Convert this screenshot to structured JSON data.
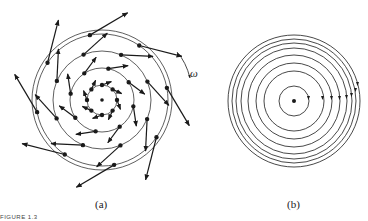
{
  "figure": {
    "caption": "FIGURE 1.3",
    "panel_a": {
      "label": "(a)",
      "annotation": "ω",
      "description": "Velocity vectors on concentric circles of a rotating flow (spiral arrow field)"
    },
    "panel_b": {
      "label": "(b)",
      "description": "Concentric circular streamlines with arrowheads, center point"
    }
  }
}
